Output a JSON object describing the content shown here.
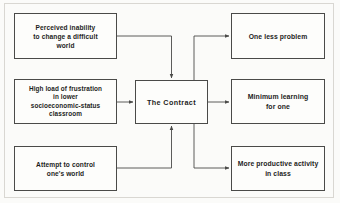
{
  "figure": {
    "type": "flowchart",
    "orientation": "left-to-right",
    "frame_color": "#d9d7d2",
    "background_color": "#fbfbf9",
    "line_color": "#4a4a48"
  },
  "nodes": {
    "inputs": [
      {
        "id": "perceived-inability",
        "label": "Perceived inability\nto change a difficult\nworld"
      },
      {
        "id": "high-load-frustration",
        "label": "High load of frustration\nin lower\nsocioeconomic-status\nclassroom"
      },
      {
        "id": "attempt-control",
        "label": "Attempt to control\none's world"
      }
    ],
    "center": {
      "id": "the-contract",
      "label": "The Contract"
    },
    "outputs": [
      {
        "id": "one-less-problem",
        "label": "One less problem"
      },
      {
        "id": "minimum-learning",
        "label": "Minimum learning\nfor one"
      },
      {
        "id": "more-productive",
        "label": "More productive activity\nin class"
      }
    ]
  },
  "connectors": [
    {
      "from": "perceived-inability",
      "to": "the-contract",
      "style": "orthogonal",
      "arrowhead": "at-target"
    },
    {
      "from": "high-load-frustration",
      "to": "the-contract",
      "style": "straight",
      "arrowhead": "at-target"
    },
    {
      "from": "attempt-control",
      "to": "the-contract",
      "style": "orthogonal",
      "arrowhead": "at-target"
    },
    {
      "from": "the-contract",
      "to": "one-less-problem",
      "style": "orthogonal",
      "arrowhead": "at-target"
    },
    {
      "from": "the-contract",
      "to": "minimum-learning",
      "style": "straight",
      "arrowhead": "at-target"
    },
    {
      "from": "the-contract",
      "to": "more-productive",
      "style": "orthogonal",
      "arrowhead": "at-target"
    }
  ]
}
